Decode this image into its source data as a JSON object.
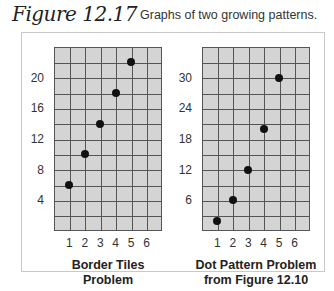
{
  "figure": {
    "label": "Figure 12.17",
    "caption": "Graphs of two growing patterns."
  },
  "chart_data": [
    {
      "type": "scatter",
      "title": "Border Tiles Problem",
      "xlabel_line1": "Border Tiles",
      "xlabel_line2": "Problem",
      "ylabel": "",
      "x": [
        1,
        2,
        3,
        4,
        5
      ],
      "values": [
        6,
        10,
        14,
        18,
        22
      ],
      "xticks": [
        "1",
        "2",
        "3",
        "4",
        "5",
        "6"
      ],
      "yticks": [
        "4",
        "8",
        "12",
        "16",
        "20"
      ],
      "xlim": [
        0,
        7
      ],
      "ylim": [
        0,
        24
      ],
      "grid": true
    },
    {
      "type": "scatter",
      "title": "Dot Pattern Problem from Figure 12.10",
      "xlabel_line1": "Dot Pattern Problem",
      "xlabel_line2": "from Figure 12.10",
      "ylabel": "",
      "x": [
        1,
        2,
        3,
        4,
        5
      ],
      "values": [
        2,
        6,
        12,
        20,
        30
      ],
      "xticks": [
        "1",
        "2",
        "3",
        "4",
        "5",
        "6"
      ],
      "yticks": [
        "6",
        "12",
        "18",
        "24",
        "30"
      ],
      "xlim": [
        0,
        7
      ],
      "ylim": [
        0,
        36
      ],
      "grid": true
    }
  ]
}
